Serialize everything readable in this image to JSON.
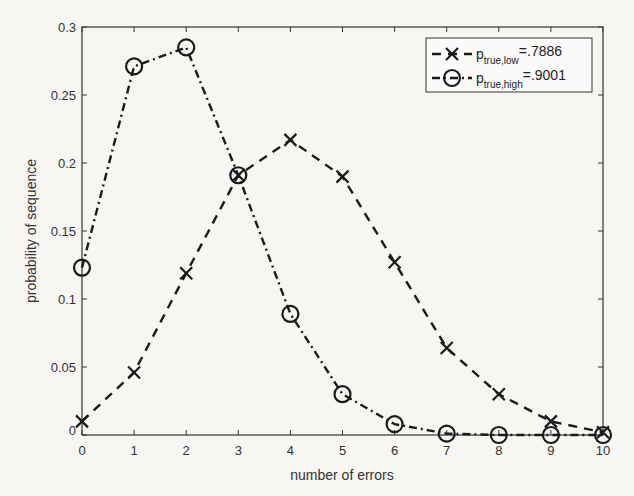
{
  "chart_data": {
    "type": "line",
    "title": "",
    "xlabel": "number of errors",
    "ylabel": "probability of sequence",
    "x": [
      0,
      1,
      2,
      3,
      4,
      5,
      6,
      7,
      8,
      9,
      10
    ],
    "xlim": [
      0,
      10
    ],
    "ylim": [
      0,
      0.3
    ],
    "xticks": [
      "0",
      "1",
      "2",
      "3",
      "4",
      "5",
      "6",
      "7",
      "8",
      "9",
      "10"
    ],
    "yticks": [
      "0",
      "0.05",
      "0.1",
      "0.15",
      "0.2",
      "0.25",
      "0.3"
    ],
    "grid": false,
    "legend_position": "upper right",
    "series": [
      {
        "name": "p_true,low=.7886",
        "legend_main": "p",
        "legend_sub": "true,low",
        "legend_value": "=.7886",
        "marker": "x",
        "line_style": "dashed",
        "values": [
          0.01,
          0.046,
          0.119,
          0.191,
          0.217,
          0.19,
          0.127,
          0.064,
          0.03,
          0.01,
          0.002
        ]
      },
      {
        "name": "p_true,high=.9001",
        "legend_main": "p",
        "legend_sub": "true,high",
        "legend_value": "=.9001",
        "marker": "o",
        "line_style": "dash-dot",
        "values": [
          0.123,
          0.271,
          0.285,
          0.191,
          0.089,
          0.03,
          0.008,
          0.001,
          0.0,
          0.0,
          0.0
        ]
      }
    ]
  },
  "colors": {
    "line": "#1a1a1a",
    "axis": "#333333",
    "background": "#f7f6f3"
  }
}
